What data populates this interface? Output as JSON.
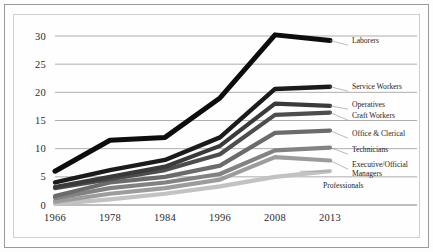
{
  "chart_data": {
    "type": "line",
    "title": "",
    "subtitle": "",
    "xlabel": "",
    "ylabel": "",
    "categories": [
      "1966",
      "1978",
      "1984",
      "1996",
      "2008",
      "2013"
    ],
    "x": [
      1966,
      1978,
      1984,
      1996,
      2008,
      2013
    ],
    "ylim": [
      0,
      30
    ],
    "yticks": [
      0,
      5,
      10,
      15,
      20,
      25,
      30
    ],
    "xticks": [
      "1966",
      "1978",
      "1984",
      "1996",
      "2008",
      "2013"
    ],
    "grid": true,
    "legend_position": "right-inline-labels",
    "series": [
      {
        "name": "Laborers",
        "color": "#0d0d0d",
        "width": 5.0,
        "values": [
          6.0,
          11.5,
          12.0,
          19.0,
          30.2,
          29.2
        ],
        "label_x": 352,
        "label_y": 43
      },
      {
        "name": "Service Workers",
        "color": "#1b1b1b",
        "width": 4.4,
        "values": [
          4.0,
          6.2,
          8.0,
          12.0,
          20.6,
          21.0
        ],
        "label_x": 352,
        "label_y": 89
      },
      {
        "name": "Operatives",
        "color": "#3a3a3a",
        "width": 4.2,
        "values": [
          3.2,
          5.0,
          6.8,
          10.5,
          18.0,
          17.6
        ],
        "label_x": 352,
        "label_y": 107
      },
      {
        "name": "Craft Workers",
        "color": "#4d4d4d",
        "width": 4.2,
        "values": [
          3.0,
          4.6,
          6.2,
          9.0,
          16.0,
          16.4
        ],
        "label_x": 352,
        "label_y": 118
      },
      {
        "name": "Office & Clerical",
        "color": "#6b6b6b",
        "width": 4.2,
        "values": [
          1.6,
          4.0,
          5.0,
          7.0,
          12.8,
          13.2
        ],
        "label_x": 352,
        "label_y": 136
      },
      {
        "name": "Technicians",
        "color": "#828282",
        "width": 4.2,
        "values": [
          1.2,
          3.0,
          4.0,
          5.5,
          9.7,
          10.2
        ],
        "label_x": 352,
        "label_y": 152
      },
      {
        "name": "Executive/Official",
        "name2": "Managers",
        "color": "#9c9c9c",
        "width": 4.2,
        "values": [
          0.6,
          2.0,
          3.0,
          4.5,
          8.5,
          7.9
        ],
        "label_x": 352,
        "label_y": 167
      },
      {
        "name": "Professionals",
        "color": "#c2c2c2",
        "width": 4.2,
        "values": [
          0.2,
          1.0,
          2.0,
          3.3,
          5.0,
          6.0
        ],
        "label_x": 323,
        "label_y": 188
      }
    ]
  },
  "axis": {
    "y_labels": [
      "30",
      "25",
      "20",
      "15",
      "10",
      "5",
      "0"
    ],
    "x_labels": [
      "1966",
      "1978",
      "1984",
      "1996",
      "2008",
      "2013"
    ]
  },
  "labels": {
    "laborers": "Laborers",
    "service_workers": "Service Workers",
    "operatives": "Operatives",
    "craft_workers": "Craft Workers",
    "office_clerical": "Office & Clerical",
    "technicians": "Technicians",
    "executive_official": "Executive/Official",
    "managers": "Managers",
    "professionals": "Professionals"
  }
}
